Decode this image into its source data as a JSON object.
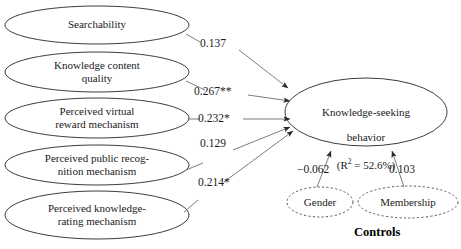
{
  "diagram": {
    "type": "structural-equation-path-diagram",
    "predictors": [
      {
        "id": "searchability",
        "label": "Searchability"
      },
      {
        "id": "knowledge-content-quality",
        "label": "Knowledge content\nquality"
      },
      {
        "id": "perceived-virtual-reward-mechanism",
        "label": "Perceived virtual\nreward mechanism"
      },
      {
        "id": "perceived-public-recognition-mechanism",
        "label": "Perceived public recog-\nnition mechanism"
      },
      {
        "id": "perceived-knowledge-rating-mechanism",
        "label": "Perceived knowledge-\nrating mechanism"
      }
    ],
    "outcome": {
      "id": "knowledge-seeking-behavior",
      "line1": "Knowledge-seeking",
      "line2": "behavior",
      "rsq_prefix": "(R",
      "rsq_exp": "2",
      "rsq_suffix": " = 52.6%)"
    },
    "paths": [
      {
        "from": "searchability",
        "to": "knowledge-seeking-behavior",
        "coefficient": "0.137"
      },
      {
        "from": "knowledge-content-quality",
        "to": "knowledge-seeking-behavior",
        "coefficient": "0.267**"
      },
      {
        "from": "perceived-virtual-reward-mechanism",
        "to": "knowledge-seeking-behavior",
        "coefficient": "0.232*"
      },
      {
        "from": "perceived-public-recognition-mechanism",
        "to": "knowledge-seeking-behavior",
        "coefficient": "0.129"
      },
      {
        "from": "perceived-knowledge-rating-mechanism",
        "to": "knowledge-seeking-behavior",
        "coefficient": "0.214*"
      }
    ],
    "controls": {
      "caption": "Controls",
      "variables": [
        {
          "id": "gender",
          "label": "Gender",
          "coefficient": "−0.062"
        },
        {
          "id": "membership",
          "label": "Membership",
          "coefficient": "0.103"
        }
      ]
    },
    "colors": {
      "stroke": "#3d3d3d",
      "text": "#1a1a1a",
      "background": "#ffffff"
    }
  }
}
